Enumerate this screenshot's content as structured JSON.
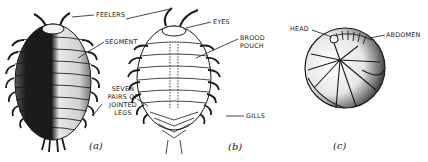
{
  "figure": {
    "panels": [
      {
        "id": "a",
        "caption": "(a)",
        "view": "dorsal"
      },
      {
        "id": "b",
        "caption": "(b)",
        "view": "ventral"
      },
      {
        "id": "c",
        "caption": "(c)",
        "view": "rolled"
      }
    ]
  },
  "labels": {
    "feelers": "FEELERS",
    "segment": "SEGMENT",
    "seven_pairs_line1": "SEVEN",
    "seven_pairs_line2": "PAIRS OF",
    "seven_pairs_line3": "JOINTED",
    "seven_pairs_line4": "LEGS",
    "eyes": "EYES",
    "brood_pouch_line1": "BROOD",
    "brood_pouch_line2": "POUCH",
    "gills": "GILLS",
    "head": "HEAD",
    "abdomen": "ABDOMEN"
  },
  "colors": {
    "ink": "#1a1a1a",
    "background": "#ffffff"
  }
}
